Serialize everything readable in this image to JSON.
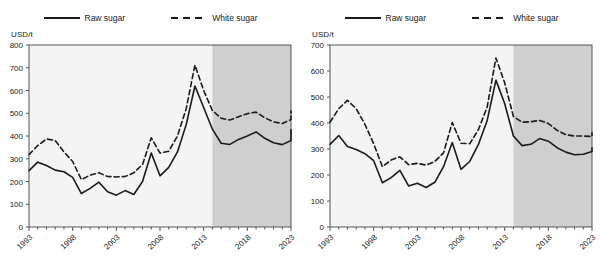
{
  "figure": {
    "panel_count": 2,
    "colors": {
      "line": "#1a1a1a",
      "plot_background": "#f4f4f4",
      "projection_shading": "#cfcfcf",
      "axis": "#555555",
      "text": "#1a1a1a"
    },
    "legend": {
      "entries": [
        {
          "label": "Raw sugar",
          "style": "solid"
        },
        {
          "label": "White sugar",
          "style": "dashed"
        }
      ]
    }
  },
  "chart_data": [
    {
      "type": "line",
      "title": "",
      "xlabel": "",
      "ylabel": "USD/t",
      "unit_label": "USD/t",
      "ylim": [
        0,
        800
      ],
      "yticks": [
        0,
        100,
        200,
        300,
        400,
        500,
        600,
        700,
        800
      ],
      "xlim": [
        1993,
        2023
      ],
      "xticks": [
        1993,
        1998,
        2003,
        2008,
        2013,
        2018,
        2023
      ],
      "xtick_labels": [
        "1993",
        "1998",
        "2003",
        "2008",
        "2013",
        "2018",
        "2023"
      ],
      "grid": false,
      "legend_position": "top-center",
      "projection_start": 2014,
      "projection_shaded": true,
      "x": [
        1993,
        1994,
        1995,
        1996,
        1997,
        1998,
        1999,
        2000,
        2001,
        2002,
        2003,
        2004,
        2005,
        2006,
        2007,
        2008,
        2009,
        2010,
        2011,
        2012,
        2013,
        2014,
        2015,
        2016,
        2017,
        2018,
        2019,
        2020,
        2021,
        2022,
        2023
      ],
      "series": [
        {
          "name": "Raw sugar",
          "style": "solid",
          "values": [
            248,
            285,
            270,
            250,
            243,
            218,
            147,
            170,
            197,
            155,
            140,
            160,
            143,
            200,
            325,
            225,
            262,
            330,
            450,
            620,
            525,
            430,
            368,
            363,
            385,
            400,
            418,
            390,
            370,
            362,
            380,
            405,
            428
          ]
        },
        {
          "name": "White sugar",
          "style": "dashed",
          "values": [
            318,
            358,
            387,
            380,
            330,
            288,
            208,
            228,
            238,
            222,
            220,
            222,
            238,
            275,
            392,
            325,
            333,
            400,
            520,
            712,
            600,
            512,
            478,
            470,
            485,
            498,
            505,
            480,
            462,
            455,
            472,
            492,
            510
          ]
        }
      ]
    },
    {
      "type": "line",
      "title": "",
      "xlabel": "",
      "ylabel": "USD/t",
      "unit_label": "USD/t",
      "ylim": [
        0,
        700
      ],
      "yticks": [
        0,
        100,
        200,
        300,
        400,
        500,
        600,
        700
      ],
      "xlim": [
        1993,
        2023
      ],
      "xticks": [
        1993,
        1998,
        2003,
        2008,
        2013,
        2018,
        2023
      ],
      "xtick_labels": [
        "1993",
        "1998",
        "2003",
        "2008",
        "2013",
        "2018",
        "2023"
      ],
      "grid": false,
      "legend_position": "top-center",
      "projection_start": 2014,
      "projection_shaded": true,
      "x": [
        1993,
        1994,
        1995,
        1996,
        1997,
        1998,
        1999,
        2000,
        2001,
        2002,
        2003,
        2004,
        2005,
        2006,
        2007,
        2008,
        2009,
        2010,
        2011,
        2012,
        2013,
        2014,
        2015,
        2016,
        2017,
        2018,
        2019,
        2020,
        2021,
        2022,
        2023
      ],
      "series": [
        {
          "name": "Raw sugar",
          "style": "solid",
          "values": [
            318,
            352,
            310,
            298,
            282,
            255,
            170,
            190,
            218,
            158,
            168,
            152,
            172,
            232,
            325,
            222,
            252,
            318,
            410,
            565,
            475,
            350,
            313,
            318,
            340,
            330,
            305,
            288,
            278,
            280,
            290,
            300,
            305
          ]
        },
        {
          "name": "White sugar",
          "style": "dashed",
          "values": [
            403,
            455,
            487,
            455,
            395,
            320,
            232,
            258,
            270,
            240,
            245,
            238,
            252,
            285,
            402,
            322,
            320,
            375,
            462,
            650,
            555,
            425,
            403,
            405,
            410,
            398,
            372,
            355,
            350,
            350,
            348,
            358,
            362
          ]
        }
      ]
    }
  ]
}
